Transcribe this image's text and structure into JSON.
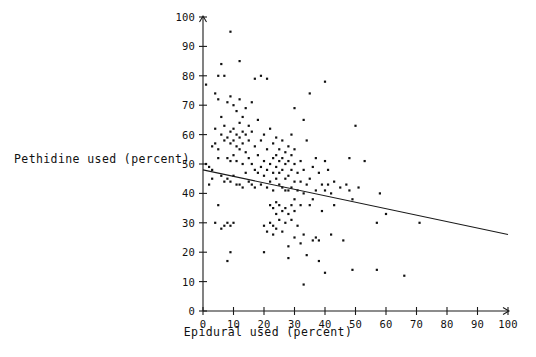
{
  "chart_data": {
    "type": "scatter",
    "title": "",
    "xlabel": "Epidural used (percent)",
    "ylabel": "Pethidine used (percent)",
    "xlim": [
      0,
      100
    ],
    "ylim": [
      0,
      100
    ],
    "xticks": [
      0,
      10,
      20,
      30,
      40,
      50,
      60,
      70,
      80,
      90,
      100
    ],
    "yticks": [
      0,
      10,
      20,
      30,
      40,
      50,
      60,
      70,
      80,
      90,
      100
    ],
    "xticklabels": [
      "0",
      "10",
      "20",
      "30",
      "40",
      "50",
      "60",
      "70",
      "80",
      "90",
      "100"
    ],
    "yticklabels": [
      "0",
      "10",
      "20",
      "30",
      "40",
      "50",
      "60",
      "70",
      "80",
      "90",
      "100"
    ],
    "grid": false,
    "legend": null,
    "marker": "square",
    "marker_color": "#111111",
    "series": [
      {
        "name": "hospitals",
        "points": [
          [
            1,
            77
          ],
          [
            1,
            50
          ],
          [
            2,
            49
          ],
          [
            2,
            43
          ],
          [
            3,
            56
          ],
          [
            3,
            48
          ],
          [
            3,
            45
          ],
          [
            4,
            74
          ],
          [
            4,
            62
          ],
          [
            4,
            57
          ],
          [
            4,
            30
          ],
          [
            5,
            80
          ],
          [
            5,
            72
          ],
          [
            5,
            55
          ],
          [
            5,
            52
          ],
          [
            5,
            36
          ],
          [
            6,
            84
          ],
          [
            6,
            66
          ],
          [
            6,
            60
          ],
          [
            6,
            46
          ],
          [
            6,
            28
          ],
          [
            7,
            80
          ],
          [
            7,
            63
          ],
          [
            7,
            58
          ],
          [
            7,
            44
          ],
          [
            7,
            29
          ],
          [
            8,
            71
          ],
          [
            8,
            59
          ],
          [
            8,
            52
          ],
          [
            8,
            45
          ],
          [
            8,
            30
          ],
          [
            8,
            17
          ],
          [
            9,
            95
          ],
          [
            9,
            73
          ],
          [
            9,
            61
          ],
          [
            9,
            57
          ],
          [
            9,
            51
          ],
          [
            9,
            44
          ],
          [
            9,
            29
          ],
          [
            9,
            20
          ],
          [
            10,
            70
          ],
          [
            10,
            62
          ],
          [
            10,
            58
          ],
          [
            10,
            53
          ],
          [
            10,
            46
          ],
          [
            10,
            30
          ],
          [
            11,
            68
          ],
          [
            11,
            60
          ],
          [
            11,
            56
          ],
          [
            11,
            51
          ],
          [
            11,
            43
          ],
          [
            12,
            85
          ],
          [
            12,
            72
          ],
          [
            12,
            64
          ],
          [
            12,
            59
          ],
          [
            12,
            55
          ],
          [
            12,
            43
          ],
          [
            13,
            66
          ],
          [
            13,
            61
          ],
          [
            13,
            57
          ],
          [
            13,
            50
          ],
          [
            13,
            42
          ],
          [
            14,
            69
          ],
          [
            14,
            60
          ],
          [
            14,
            54
          ],
          [
            14,
            47
          ],
          [
            15,
            63
          ],
          [
            15,
            58
          ],
          [
            15,
            52
          ],
          [
            15,
            44
          ],
          [
            16,
            71
          ],
          [
            16,
            61
          ],
          [
            16,
            50
          ],
          [
            16,
            43
          ],
          [
            17,
            79
          ],
          [
            17,
            56
          ],
          [
            17,
            48
          ],
          [
            17,
            42
          ],
          [
            18,
            65
          ],
          [
            18,
            53
          ],
          [
            18,
            47
          ],
          [
            19,
            80
          ],
          [
            19,
            58
          ],
          [
            19,
            49
          ],
          [
            19,
            43
          ],
          [
            20,
            60
          ],
          [
            20,
            51
          ],
          [
            20,
            46
          ],
          [
            20,
            29
          ],
          [
            20,
            20
          ],
          [
            21,
            79
          ],
          [
            21,
            55
          ],
          [
            21,
            48
          ],
          [
            21,
            42
          ],
          [
            21,
            27
          ],
          [
            22,
            62
          ],
          [
            22,
            50
          ],
          [
            22,
            44
          ],
          [
            22,
            36
          ],
          [
            22,
            30
          ],
          [
            23,
            57
          ],
          [
            23,
            52
          ],
          [
            23,
            47
          ],
          [
            23,
            41
          ],
          [
            23,
            35
          ],
          [
            23,
            29
          ],
          [
            23,
            26
          ],
          [
            24,
            59
          ],
          [
            24,
            53
          ],
          [
            24,
            49
          ],
          [
            24,
            45
          ],
          [
            24,
            37
          ],
          [
            24,
            33
          ],
          [
            24,
            28
          ],
          [
            25,
            55
          ],
          [
            25,
            51
          ],
          [
            25,
            47
          ],
          [
            25,
            43
          ],
          [
            25,
            36
          ],
          [
            25,
            31
          ],
          [
            26,
            58
          ],
          [
            26,
            52
          ],
          [
            26,
            48
          ],
          [
            26,
            42
          ],
          [
            26,
            34
          ],
          [
            26,
            27
          ],
          [
            27,
            54
          ],
          [
            27,
            50
          ],
          [
            27,
            45
          ],
          [
            27,
            41
          ],
          [
            27,
            35
          ],
          [
            27,
            30
          ],
          [
            28,
            56
          ],
          [
            28,
            51
          ],
          [
            28,
            46
          ],
          [
            28,
            41
          ],
          [
            28,
            33
          ],
          [
            28,
            22
          ],
          [
            28,
            18
          ],
          [
            29,
            60
          ],
          [
            29,
            53
          ],
          [
            29,
            48
          ],
          [
            29,
            42
          ],
          [
            29,
            36
          ],
          [
            29,
            31
          ],
          [
            30,
            69
          ],
          [
            30,
            55
          ],
          [
            30,
            50
          ],
          [
            30,
            44
          ],
          [
            30,
            38
          ],
          [
            30,
            34
          ],
          [
            30,
            25
          ],
          [
            31,
            47
          ],
          [
            31,
            41
          ],
          [
            31,
            29
          ],
          [
            32,
            51
          ],
          [
            32,
            44
          ],
          [
            32,
            36
          ],
          [
            32,
            23
          ],
          [
            33,
            65
          ],
          [
            33,
            48
          ],
          [
            33,
            40
          ],
          [
            33,
            26
          ],
          [
            33,
            9
          ],
          [
            34,
            58
          ],
          [
            34,
            43
          ],
          [
            34,
            19
          ],
          [
            35,
            74
          ],
          [
            35,
            45
          ],
          [
            35,
            36
          ],
          [
            36,
            49
          ],
          [
            36,
            38
          ],
          [
            36,
            24
          ],
          [
            37,
            52
          ],
          [
            37,
            41
          ],
          [
            37,
            25
          ],
          [
            38,
            47
          ],
          [
            38,
            24
          ],
          [
            38,
            17
          ],
          [
            39,
            43
          ],
          [
            39,
            34
          ],
          [
            40,
            78
          ],
          [
            40,
            51
          ],
          [
            40,
            41
          ],
          [
            40,
            13
          ],
          [
            41,
            48
          ],
          [
            41,
            43
          ],
          [
            42,
            40
          ],
          [
            42,
            26
          ],
          [
            43,
            44
          ],
          [
            43,
            36
          ],
          [
            45,
            42
          ],
          [
            46,
            24
          ],
          [
            47,
            43
          ],
          [
            48,
            52
          ],
          [
            48,
            41
          ],
          [
            49,
            38
          ],
          [
            49,
            14
          ],
          [
            50,
            63
          ],
          [
            51,
            42
          ],
          [
            53,
            51
          ],
          [
            57,
            30
          ],
          [
            57,
            14
          ],
          [
            58,
            40
          ],
          [
            60,
            33
          ],
          [
            66,
            12
          ],
          [
            71,
            30
          ]
        ]
      }
    ],
    "trendline": {
      "type": "linear-fit",
      "x_start": 0,
      "y_start": 48,
      "x_end": 100,
      "y_end": 26,
      "slope": -0.22,
      "intercept": 48
    }
  },
  "axes": {
    "x_label": "Epidural used (percent)",
    "y_label": "Pethidine used (percent)"
  }
}
